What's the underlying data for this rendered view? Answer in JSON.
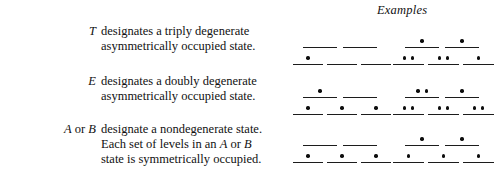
{
  "header": {
    "examples_label": "Examples"
  },
  "rows": [
    {
      "id": "t",
      "symbol": "T",
      "symbol_parts": [
        {
          "text": "T",
          "italic": true
        }
      ],
      "description_lines": [
        "designates a triply degenerate",
        "asymmetrically occupied state."
      ],
      "diagrams": [
        {
          "side": "left",
          "upper": {
            "levels": [
              {
                "electrons": 0
              },
              {
                "electrons": 0
              }
            ]
          },
          "lower": {
            "levels": [
              {
                "electrons": 1
              },
              {
                "electrons": 0
              },
              {
                "electrons": 0
              }
            ]
          }
        },
        {
          "side": "right",
          "upper": {
            "levels": [
              {
                "electrons": 1
              },
              {
                "electrons": 1
              }
            ]
          },
          "lower": {
            "levels": [
              {
                "electrons": 2
              },
              {
                "electrons": 2
              },
              {
                "electrons": 1
              }
            ]
          }
        }
      ]
    },
    {
      "id": "e",
      "symbol": "E",
      "symbol_parts": [
        {
          "text": "E",
          "italic": true
        }
      ],
      "description_lines": [
        "designates a doubly degenerate",
        "asymmetrically occupied state."
      ],
      "diagrams": [
        {
          "side": "left",
          "upper": {
            "levels": [
              {
                "electrons": 1
              },
              {
                "electrons": 0
              }
            ]
          },
          "lower": {
            "levels": [
              {
                "electrons": 1
              },
              {
                "electrons": 1
              },
              {
                "electrons": 1
              }
            ]
          }
        },
        {
          "side": "right",
          "upper": {
            "levels": [
              {
                "electrons": 2
              },
              {
                "electrons": 1
              }
            ]
          },
          "lower": {
            "levels": [
              {
                "electrons": 2
              },
              {
                "electrons": 2
              },
              {
                "electrons": 2
              }
            ]
          }
        }
      ]
    },
    {
      "id": "ab",
      "symbol": "A or B",
      "symbol_parts": [
        {
          "text": "A",
          "italic": true
        },
        {
          "text": " or ",
          "italic": false
        },
        {
          "text": "B",
          "italic": true
        }
      ],
      "description_lines": [
        "designate a nondegenerate state.",
        "Each set of levels in an A or B",
        "state is symmetrically occupied."
      ],
      "diagrams": [
        {
          "side": "left",
          "upper": {
            "levels": [
              {
                "electrons": 0
              },
              {
                "electrons": 0
              }
            ]
          },
          "lower": {
            "levels": [
              {
                "electrons": 1
              },
              {
                "electrons": 1
              },
              {
                "electrons": 1
              }
            ]
          }
        },
        {
          "side": "right",
          "upper": {
            "levels": [
              {
                "electrons": 1
              },
              {
                "electrons": 1
              }
            ]
          },
          "lower": {
            "levels": [
              {
                "electrons": 1
              },
              {
                "electrons": 1
              },
              {
                "electrons": 1
              }
            ]
          }
        }
      ]
    }
  ],
  "style": {
    "background_color": "#ffffff",
    "ink_color": "#111111",
    "level_line_color": "#1c1c1c",
    "electron_dot_color": "#0d0d0d"
  }
}
